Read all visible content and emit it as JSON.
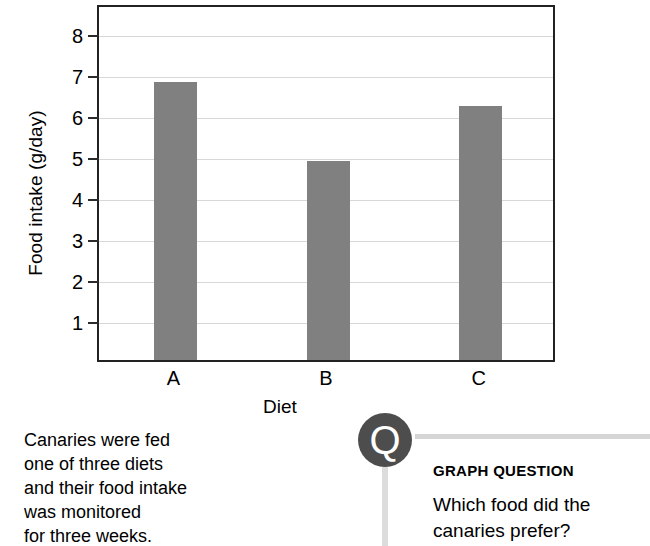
{
  "chart_data": {
    "type": "bar",
    "title": "",
    "categories": [
      "A",
      "B",
      "C"
    ],
    "values": [
      6.78,
      4.85,
      6.2
    ],
    "xlabel": "Diet",
    "ylabel": "Food intake (g/day)",
    "ylim": [
      0,
      8.7
    ],
    "yticks": [
      8,
      7,
      6,
      5,
      4,
      3,
      2,
      1
    ],
    "ytick_labels": [
      "8",
      "7",
      "6",
      "5",
      "4",
      "3",
      "2",
      "1"
    ],
    "grid": true,
    "legend": "none",
    "bar_color": "#808080",
    "frame_color": "#222222",
    "gridline_color": "#d8d8d8"
  },
  "caption": {
    "lines": [
      "Canaries were fed",
      "one of three diets",
      "and their food intake",
      "was monitored",
      "for three weeks."
    ]
  },
  "graph_question": {
    "badge_letter": "Q",
    "badge_color": "#4d4d4d",
    "rule_color": "#d5d5d5",
    "heading": "GRAPH QUESTION",
    "question_lines": [
      "Which food did the",
      "canaries prefer?"
    ]
  }
}
